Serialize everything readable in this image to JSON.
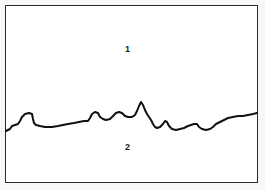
{
  "figure": {
    "width": 265,
    "height": 190,
    "background_color": "#ffffff",
    "frame": {
      "name": "outer-frame",
      "stroke_color": "#2b2b2b",
      "stroke_width": 1.5,
      "x": 5,
      "y": 5,
      "width": 253,
      "height": 178
    }
  },
  "labels": {
    "region_upper": "1",
    "region_lower": "2"
  },
  "chart_data": {
    "type": "line",
    "xlabel": "",
    "ylabel": "",
    "grid": false,
    "legend": "none",
    "series": [
      {
        "name": "boundary-line",
        "color": "#111111",
        "stroke_width": 2.0,
        "points": [
          [
            6,
            131
          ],
          [
            10,
            129
          ],
          [
            12,
            126
          ],
          [
            15,
            125
          ],
          [
            18,
            124
          ],
          [
            20,
            121
          ],
          [
            22,
            117
          ],
          [
            25,
            114
          ],
          [
            29,
            113
          ],
          [
            32,
            114
          ],
          [
            33,
            119
          ],
          [
            34,
            123
          ],
          [
            36,
            125
          ],
          [
            40,
            126
          ],
          [
            45,
            127
          ],
          [
            52,
            127
          ],
          [
            58,
            126
          ],
          [
            63,
            125
          ],
          [
            68,
            124
          ],
          [
            74,
            123
          ],
          [
            79,
            122
          ],
          [
            84,
            121
          ],
          [
            88,
            121
          ],
          [
            90,
            118
          ],
          [
            92,
            114
          ],
          [
            95,
            112
          ],
          [
            98,
            113
          ],
          [
            100,
            117
          ],
          [
            103,
            119
          ],
          [
            106,
            120
          ],
          [
            110,
            119
          ],
          [
            113,
            116
          ],
          [
            116,
            113
          ],
          [
            119,
            112
          ],
          [
            122,
            113
          ],
          [
            125,
            116
          ],
          [
            128,
            117
          ],
          [
            132,
            117
          ],
          [
            135,
            115
          ],
          [
            137,
            111
          ],
          [
            139,
            106
          ],
          [
            141,
            102
          ],
          [
            143,
            105
          ],
          [
            145,
            110
          ],
          [
            147,
            114
          ],
          [
            149,
            117
          ],
          [
            151,
            120
          ],
          [
            153,
            124
          ],
          [
            155,
            127
          ],
          [
            157,
            128
          ],
          [
            160,
            127
          ],
          [
            163,
            124
          ],
          [
            165,
            121
          ],
          [
            167,
            122
          ],
          [
            169,
            126
          ],
          [
            172,
            129
          ],
          [
            176,
            130
          ],
          [
            180,
            129
          ],
          [
            184,
            128
          ],
          [
            188,
            126
          ],
          [
            191,
            125
          ],
          [
            194,
            124
          ],
          [
            197,
            124
          ],
          [
            199,
            127
          ],
          [
            202,
            129
          ],
          [
            206,
            130
          ],
          [
            210,
            129
          ],
          [
            213,
            127
          ],
          [
            216,
            124
          ],
          [
            220,
            122
          ],
          [
            224,
            120
          ],
          [
            228,
            118
          ],
          [
            233,
            117
          ],
          [
            238,
            116
          ],
          [
            243,
            116
          ],
          [
            248,
            115
          ],
          [
            253,
            114
          ],
          [
            257,
            113
          ]
        ],
        "annotations": [
          {
            "text": "1",
            "x": 128,
            "y": 50,
            "region": "above-line"
          },
          {
            "text": "2",
            "x": 128,
            "y": 148,
            "region": "below-line"
          }
        ]
      }
    ],
    "xlim": [
      0,
      265
    ],
    "ylim": [
      190,
      0
    ]
  }
}
